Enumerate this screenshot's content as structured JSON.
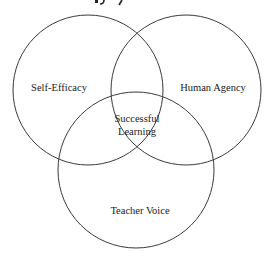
{
  "diagram": {
    "type": "venn",
    "circles": [
      {
        "id": "self-efficacy",
        "label": "Self-Efficacy",
        "cx": 88,
        "cy": 90,
        "r": 75
      },
      {
        "id": "human-agency",
        "label": "Human Agency",
        "cx": 186,
        "cy": 90,
        "r": 75
      },
      {
        "id": "teacher-voice",
        "label": "Teacher Voice",
        "cx": 136,
        "cy": 170,
        "r": 78
      }
    ],
    "center": {
      "line1": "Successful",
      "line2": "Learning"
    },
    "stroke_color": "#3a3a3a",
    "text_color": "#1a1a1a"
  }
}
